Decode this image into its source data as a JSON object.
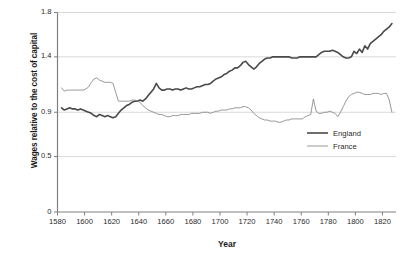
{
  "chart_data": {
    "type": "line",
    "title": "",
    "xlabel": "Year",
    "ylabel": "Wages relative to the cost of capital",
    "xlim": [
      1580,
      1830
    ],
    "ylim": [
      0,
      1.8
    ],
    "grid": true,
    "grid_axis": "y",
    "legend_position": "center-right",
    "ytick_labels": [
      "0",
      "0.5",
      "0.9",
      "1.4",
      "1.8"
    ],
    "ytick_values": [
      0,
      0.5,
      0.9,
      1.4,
      1.8
    ],
    "xtick_labels": [
      "1580",
      "1600",
      "1620",
      "1640",
      "1660",
      "1680",
      "1700",
      "1720",
      "1740",
      "1760",
      "1780",
      "1800",
      "1820"
    ],
    "xtick_values": [
      1580,
      1600,
      1620,
      1640,
      1660,
      1680,
      1700,
      1720,
      1740,
      1760,
      1780,
      1800,
      1820
    ],
    "colors": {
      "england": "#4a4a4a",
      "france": "#8c8c8c",
      "grid": "#d9d9d9",
      "axis": "#808080"
    },
    "series": [
      {
        "name": "England",
        "color": "#4a4a4a",
        "line_width": 1.6,
        "x": [
          1583,
          1585,
          1587,
          1589,
          1591,
          1593,
          1595,
          1597,
          1599,
          1601,
          1603,
          1605,
          1607,
          1609,
          1611,
          1613,
          1615,
          1617,
          1619,
          1621,
          1623,
          1625,
          1627,
          1629,
          1631,
          1633,
          1635,
          1637,
          1639,
          1641,
          1643,
          1645,
          1647,
          1649,
          1651,
          1653,
          1655,
          1657,
          1659,
          1661,
          1663,
          1665,
          1667,
          1669,
          1671,
          1673,
          1675,
          1677,
          1679,
          1681,
          1683,
          1685,
          1687,
          1689,
          1691,
          1693,
          1695,
          1697,
          1699,
          1701,
          1703,
          1705,
          1707,
          1709,
          1711,
          1713,
          1715,
          1717,
          1719,
          1721,
          1723,
          1725,
          1727,
          1729,
          1731,
          1733,
          1735,
          1737,
          1739,
          1741,
          1743,
          1745,
          1747,
          1749,
          1751,
          1753,
          1755,
          1757,
          1759,
          1761,
          1763,
          1765,
          1767,
          1769,
          1771,
          1773,
          1775,
          1777,
          1779,
          1781,
          1783,
          1785,
          1787,
          1789,
          1791,
          1793,
          1795,
          1797,
          1799,
          1801,
          1803,
          1805,
          1807,
          1809,
          1811,
          1813,
          1815,
          1817,
          1819,
          1821,
          1823,
          1825,
          1827
        ],
        "y": [
          0.94,
          0.92,
          0.93,
          0.94,
          0.93,
          0.93,
          0.92,
          0.93,
          0.92,
          0.91,
          0.9,
          0.89,
          0.87,
          0.86,
          0.88,
          0.87,
          0.86,
          0.87,
          0.86,
          0.85,
          0.86,
          0.89,
          0.92,
          0.94,
          0.96,
          0.97,
          0.99,
          1.0,
          1.0,
          1.01,
          1.0,
          1.02,
          1.05,
          1.08,
          1.11,
          1.16,
          1.12,
          1.1,
          1.1,
          1.11,
          1.11,
          1.1,
          1.11,
          1.11,
          1.1,
          1.11,
          1.12,
          1.11,
          1.11,
          1.12,
          1.13,
          1.13,
          1.14,
          1.15,
          1.15,
          1.16,
          1.18,
          1.2,
          1.21,
          1.22,
          1.24,
          1.25,
          1.27,
          1.28,
          1.3,
          1.3,
          1.32,
          1.35,
          1.36,
          1.33,
          1.31,
          1.29,
          1.31,
          1.34,
          1.36,
          1.38,
          1.39,
          1.39,
          1.4,
          1.4,
          1.4,
          1.4,
          1.4,
          1.4,
          1.4,
          1.39,
          1.39,
          1.39,
          1.4,
          1.4,
          1.4,
          1.4,
          1.4,
          1.4,
          1.4,
          1.42,
          1.44,
          1.45,
          1.45,
          1.45,
          1.46,
          1.45,
          1.44,
          1.42,
          1.4,
          1.39,
          1.39,
          1.4,
          1.45,
          1.43,
          1.47,
          1.44,
          1.5,
          1.47,
          1.52,
          1.54,
          1.56,
          1.58,
          1.6,
          1.63,
          1.65,
          1.67,
          1.7
        ]
      },
      {
        "name": "France",
        "color": "#8c8c8c",
        "line_width": 0.9,
        "x": [
          1583,
          1585,
          1587,
          1589,
          1591,
          1593,
          1595,
          1597,
          1599,
          1601,
          1603,
          1605,
          1607,
          1609,
          1611,
          1613,
          1615,
          1617,
          1619,
          1621,
          1623,
          1625,
          1627,
          1629,
          1631,
          1633,
          1635,
          1637,
          1639,
          1641,
          1643,
          1645,
          1647,
          1649,
          1651,
          1653,
          1655,
          1657,
          1659,
          1661,
          1663,
          1665,
          1667,
          1669,
          1671,
          1673,
          1675,
          1677,
          1679,
          1681,
          1683,
          1685,
          1687,
          1689,
          1691,
          1693,
          1695,
          1697,
          1699,
          1701,
          1703,
          1705,
          1707,
          1709,
          1711,
          1713,
          1715,
          1717,
          1719,
          1721,
          1723,
          1725,
          1727,
          1729,
          1731,
          1733,
          1735,
          1737,
          1739,
          1741,
          1743,
          1745,
          1747,
          1749,
          1751,
          1753,
          1755,
          1757,
          1759,
          1761,
          1763,
          1765,
          1767,
          1769,
          1771,
          1773,
          1775,
          1777,
          1779,
          1781,
          1783,
          1785,
          1787,
          1789,
          1791,
          1793,
          1795,
          1797,
          1799,
          1801,
          1803,
          1805,
          1807,
          1809,
          1811,
          1813,
          1815,
          1817,
          1819,
          1821,
          1823,
          1825,
          1827
        ],
        "y": [
          1.12,
          1.09,
          1.1,
          1.1,
          1.1,
          1.1,
          1.1,
          1.1,
          1.1,
          1.11,
          1.13,
          1.17,
          1.2,
          1.21,
          1.19,
          1.18,
          1.17,
          1.17,
          1.17,
          1.16,
          1.08,
          1.0,
          1.0,
          1.0,
          1.0,
          1.0,
          1.01,
          1.01,
          1.0,
          0.99,
          0.96,
          0.94,
          0.92,
          0.91,
          0.9,
          0.89,
          0.88,
          0.88,
          0.87,
          0.86,
          0.86,
          0.87,
          0.87,
          0.87,
          0.88,
          0.88,
          0.88,
          0.88,
          0.89,
          0.89,
          0.89,
          0.89,
          0.9,
          0.9,
          0.9,
          0.89,
          0.9,
          0.91,
          0.91,
          0.92,
          0.92,
          0.92,
          0.93,
          0.93,
          0.94,
          0.94,
          0.94,
          0.95,
          0.95,
          0.94,
          0.92,
          0.89,
          0.87,
          0.85,
          0.84,
          0.83,
          0.83,
          0.82,
          0.82,
          0.82,
          0.81,
          0.81,
          0.82,
          0.83,
          0.83,
          0.84,
          0.84,
          0.84,
          0.84,
          0.84,
          0.86,
          0.87,
          0.88,
          1.02,
          0.91,
          0.89,
          0.89,
          0.9,
          0.9,
          0.91,
          0.9,
          0.89,
          0.86,
          0.9,
          0.95,
          1.0,
          1.04,
          1.06,
          1.07,
          1.08,
          1.08,
          1.07,
          1.06,
          1.06,
          1.06,
          1.07,
          1.07,
          1.07,
          1.06,
          1.07,
          1.07,
          1.01,
          0.9
        ]
      }
    ]
  },
  "legend": {
    "items": [
      {
        "label": "England"
      },
      {
        "label": "France"
      }
    ]
  }
}
